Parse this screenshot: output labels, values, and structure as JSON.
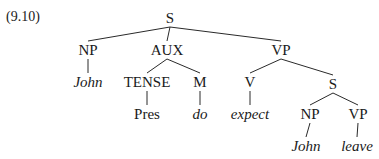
{
  "example_number": "(9.10)",
  "tree": {
    "nodes": [
      {
        "id": "s_root",
        "label": "S",
        "italic": false,
        "x": 170,
        "y": 11
      },
      {
        "id": "np_1",
        "label": "NP",
        "italic": false,
        "x": 88,
        "y": 43
      },
      {
        "id": "aux",
        "label": "AUX",
        "italic": false,
        "x": 167,
        "y": 43
      },
      {
        "id": "vp_1",
        "label": "VP",
        "italic": false,
        "x": 281,
        "y": 43
      },
      {
        "id": "john_1",
        "label": "John",
        "italic": true,
        "x": 88,
        "y": 75
      },
      {
        "id": "tense",
        "label": "TENSE",
        "italic": false,
        "x": 147,
        "y": 75
      },
      {
        "id": "m",
        "label": "M",
        "italic": false,
        "x": 200,
        "y": 75
      },
      {
        "id": "v",
        "label": "V",
        "italic": false,
        "x": 250,
        "y": 75
      },
      {
        "id": "s_embedded",
        "label": "S",
        "italic": false,
        "x": 333,
        "y": 77
      },
      {
        "id": "pres",
        "label": "Pres",
        "italic": false,
        "x": 147,
        "y": 107
      },
      {
        "id": "do",
        "label": "do",
        "italic": true,
        "x": 200,
        "y": 107
      },
      {
        "id": "expect",
        "label": "expect",
        "italic": true,
        "x": 250,
        "y": 107
      },
      {
        "id": "np_2",
        "label": "NP",
        "italic": false,
        "x": 310,
        "y": 107
      },
      {
        "id": "vp_2",
        "label": "VP",
        "italic": false,
        "x": 358,
        "y": 107
      },
      {
        "id": "john_2",
        "label": "John",
        "italic": true,
        "x": 306,
        "y": 139
      },
      {
        "id": "leave",
        "label": "leave",
        "italic": true,
        "x": 357,
        "y": 139
      }
    ],
    "edges": [
      {
        "from": "s_root",
        "to": "np_1"
      },
      {
        "from": "s_root",
        "to": "aux"
      },
      {
        "from": "s_root",
        "to": "vp_1"
      },
      {
        "from": "np_1",
        "to": "john_1"
      },
      {
        "from": "aux",
        "to": "tense"
      },
      {
        "from": "aux",
        "to": "m"
      },
      {
        "from": "vp_1",
        "to": "v"
      },
      {
        "from": "vp_1",
        "to": "s_embedded"
      },
      {
        "from": "tense",
        "to": "pres"
      },
      {
        "from": "m",
        "to": "do"
      },
      {
        "from": "v",
        "to": "expect"
      },
      {
        "from": "s_embedded",
        "to": "np_2"
      },
      {
        "from": "s_embedded",
        "to": "vp_2"
      },
      {
        "from": "np_2",
        "to": "john_2"
      },
      {
        "from": "vp_2",
        "to": "leave"
      }
    ]
  }
}
